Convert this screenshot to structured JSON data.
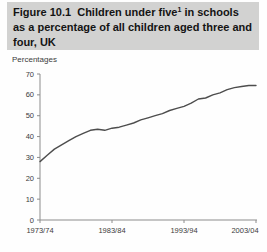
{
  "figure": {
    "title_prefix": "Figure 10.1  Children under five",
    "footnote_marker": "1",
    "title_suffix": " in schools as a percentage of all children aged three and four, UK"
  },
  "unit_label": "Percentages",
  "colors": {
    "header_bg": "#d2d2d1",
    "title_text": "#141414",
    "axis": "#8c8c8c",
    "tick_text": "#3c3c3c",
    "line": "#4d4d4d",
    "background": "#fefefe"
  },
  "chart_data": {
    "type": "line",
    "xlabel": "",
    "ylabel": "Percentages",
    "ylim": [
      0,
      70
    ],
    "yticks": [
      0,
      10,
      20,
      30,
      40,
      50,
      60,
      70
    ],
    "grid": false,
    "legend": "none",
    "xtick_labels": [
      "1973/74",
      "1983/84",
      "1993/94",
      "2003/04"
    ],
    "x": [
      "1973/74",
      "1974/75",
      "1975/76",
      "1976/77",
      "1977/78",
      "1978/79",
      "1979/80",
      "1980/81",
      "1981/82",
      "1982/83",
      "1983/84",
      "1984/85",
      "1985/86",
      "1986/87",
      "1987/88",
      "1988/89",
      "1989/90",
      "1990/91",
      "1991/92",
      "1992/93",
      "1993/94",
      "1994/95",
      "1995/96",
      "1996/97",
      "1997/98",
      "1998/99",
      "1999/00",
      "2000/01",
      "2001/02",
      "2002/03",
      "2003/04"
    ],
    "series": [
      {
        "name": "Children under five in schools (% of all children aged three and four)",
        "values": [
          28,
          31,
          34,
          36,
          38,
          40,
          41.5,
          43,
          43.5,
          43,
          44,
          44.5,
          45.5,
          46.5,
          48,
          49,
          50,
          51,
          52.5,
          53.5,
          54.5,
          56,
          58,
          58.5,
          60,
          61,
          62.5,
          63.5,
          64,
          64.5,
          64.5
        ]
      }
    ],
    "line_color": "#4d4d4d"
  }
}
